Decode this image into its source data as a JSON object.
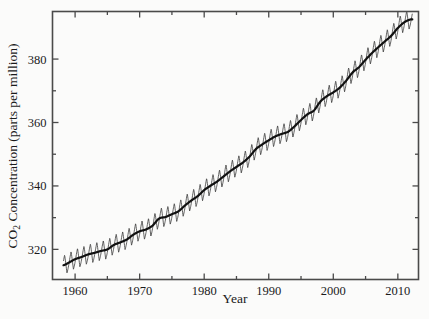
{
  "chart_data": {
    "type": "line",
    "title": "",
    "subtitle": "",
    "xlabel": "Year",
    "ylabel": "CO2 Concentration (parts per million)",
    "ylabel_parts": {
      "pre": "CO",
      "subscript": "2",
      "post": " Concentration (parts per million)"
    },
    "xlim": [
      1956.5,
      2013.2
    ],
    "ylim": [
      310.5,
      395.0
    ],
    "xticks": [
      1960,
      1970,
      1980,
      1990,
      2000,
      2010
    ],
    "xtick_labels": [
      "1960",
      "1970",
      "1980",
      "1990",
      "2000",
      "2010"
    ],
    "xminor_ticks": [
      1965,
      1975,
      1985,
      1995,
      2005
    ],
    "yticks": [
      320,
      340,
      360,
      380
    ],
    "ytick_labels": [
      "320",
      "340",
      "360",
      "380"
    ],
    "yminor_ticks": [
      330,
      350,
      370
    ],
    "grid": false,
    "legend": null,
    "legend_position": "none",
    "frame": "box",
    "tick_direction": "in",
    "series": [
      {
        "name": "Monthly mean CO2 (seasonal cycle)",
        "style": "thin-line",
        "color": "#3a3a3a",
        "linewidth": 0.8,
        "seasonal_amplitude_ppm": 3.1,
        "description": "Monthly Mauna Loa record showing annual sawtooth oscillation superimposed on rising trend"
      },
      {
        "name": "Annual trend (smoothed)",
        "style": "thick-line",
        "color": "#111111",
        "linewidth": 2.2,
        "x": [
          1958.2,
          1959,
          1960,
          1961,
          1962,
          1963,
          1964,
          1965,
          1966,
          1967,
          1968,
          1969,
          1970,
          1971,
          1972,
          1973,
          1974,
          1975,
          1976,
          1977,
          1978,
          1979,
          1980,
          1981,
          1982,
          1983,
          1984,
          1985,
          1986,
          1987,
          1988,
          1989,
          1990,
          1991,
          1992,
          1993,
          1994,
          1995,
          1996,
          1997,
          1998,
          1999,
          2000,
          2001,
          2002,
          2003,
          2004,
          2005,
          2006,
          2007,
          2008,
          2009,
          2010,
          2011,
          2012
        ],
        "values": [
          315.0,
          315.8,
          316.9,
          317.6,
          318.4,
          318.9,
          319.5,
          320.0,
          321.4,
          322.2,
          323.1,
          324.6,
          325.7,
          326.3,
          327.5,
          329.7,
          330.2,
          331.1,
          332.0,
          333.8,
          335.4,
          336.8,
          338.7,
          340.1,
          341.4,
          343.0,
          344.6,
          346.0,
          347.4,
          349.2,
          351.6,
          353.1,
          354.4,
          355.6,
          356.4,
          357.1,
          358.8,
          360.8,
          362.6,
          363.8,
          366.6,
          368.3,
          369.5,
          371.0,
          373.2,
          375.8,
          377.5,
          379.8,
          381.9,
          383.8,
          385.6,
          387.4,
          389.8,
          391.6,
          392.5
        ]
      }
    ],
    "source_description": "Keeling Curve — atmospheric CO2 concentration measured at Mauna Loa Observatory"
  },
  "colors": {
    "background": "#fbfbfa",
    "frame": "#4a4a4a",
    "trend_line": "#111111",
    "seasonal_line": "#3a3a3a",
    "text": "#1a1a1a"
  }
}
